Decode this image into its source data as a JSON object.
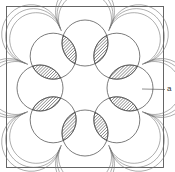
{
  "figure": {
    "type": "patent-diagram",
    "circle_count": 8,
    "labels": [
      {
        "id": "a",
        "text": "a",
        "points_to": "right circle"
      }
    ],
    "colors": {
      "line": "#444444",
      "hatch": "#555555",
      "background": "#ffffff"
    }
  }
}
